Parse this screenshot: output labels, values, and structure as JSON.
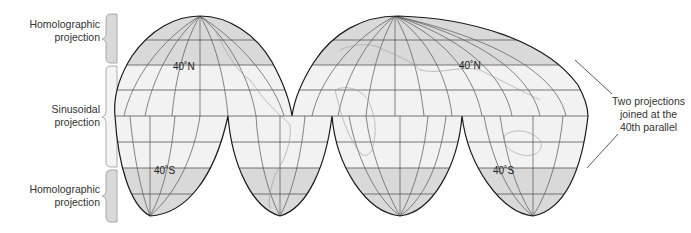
{
  "left_labels": [
    {
      "id": "top",
      "line1": "Homolographic",
      "line2": "projection"
    },
    {
      "id": "middle",
      "line1": "Sinusoidal",
      "line2": "projection"
    },
    {
      "id": "bottom",
      "line1": "Homolographic",
      "line2": "projection"
    }
  ],
  "lat_labels": {
    "n1": "40˚N",
    "s1": "40˚S",
    "n2": "40˚N",
    "s2": "40˚S"
  },
  "annotation": {
    "line1": "Two projections",
    "line2": "joined at the",
    "line3": "40th parallel"
  },
  "colors": {
    "homolographic_fill": "#d9d9d9",
    "sinusoidal_fill": "#f2f2f2",
    "outline": "#1a1a1a",
    "grid": "#555555"
  }
}
